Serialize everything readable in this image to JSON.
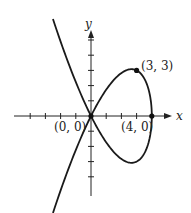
{
  "axes": {
    "x_label": "x",
    "y_label": "y",
    "origin_px": [
      91,
      116
    ],
    "unit_px": 15.2,
    "x_ticks": [
      -4,
      -3,
      -2,
      -1,
      1,
      2,
      3,
      4
    ],
    "y_ticks": [
      -4,
      -3,
      -2,
      -1,
      1,
      2,
      3,
      4,
      5
    ]
  },
  "curve": {
    "description": "Parametric curve x = 4 - t^2, y = t^3 - 4t",
    "color": "#1a1a1a"
  },
  "points": [
    {
      "label": "(0, 0)",
      "x": 0,
      "y": 0
    },
    {
      "label": "(4, 0)",
      "x": 4,
      "y": 0
    },
    {
      "label": "(3, 3)",
      "x": 3,
      "y": 3
    }
  ]
}
